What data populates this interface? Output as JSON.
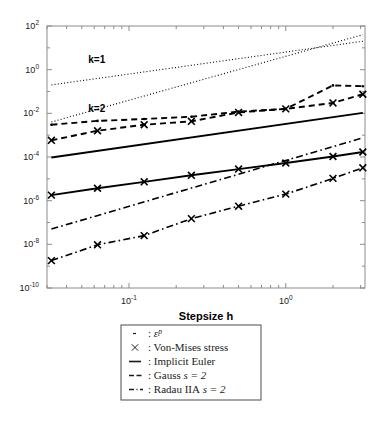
{
  "figure": {
    "background": "#ffffff",
    "axis_color": "#8c8c8c",
    "line_color": "#000000"
  },
  "labels": {
    "k1": "k=1",
    "k2": "k=2",
    "xaxis_title": "Stepsize h"
  },
  "yticks": [
    {
      "base": "10",
      "exp": "2"
    },
    {
      "base": "10",
      "exp": "0"
    },
    {
      "base": "10",
      "exp": "-2"
    },
    {
      "base": "10",
      "exp": "-4"
    },
    {
      "base": "10",
      "exp": "-6"
    },
    {
      "base": "10",
      "exp": "-8"
    },
    {
      "base": "10",
      "exp": "-10"
    }
  ],
  "xticks": [
    {
      "base": "10",
      "exp": "-1"
    },
    {
      "base": "10",
      "exp": "0"
    }
  ],
  "legend": {
    "items": [
      {
        "symbol": "dotted",
        "sep": ":",
        "label": "ε",
        "sup": "p",
        "italic_label": true
      },
      {
        "symbol": "cross",
        "sep": ":",
        "label": "Von-Mises stress",
        "sup": "",
        "italic_label": false
      },
      {
        "symbol": "solid",
        "sep": ":",
        "label": "Implicit Euler",
        "sup": "",
        "italic_label": false
      },
      {
        "symbol": "dashed",
        "sep": ":",
        "label": "Gauss",
        "sup": "",
        "italic_label": false,
        "math": "s = 2"
      },
      {
        "symbol": "dashdot",
        "sep": ":",
        "label": "Radau IIA",
        "sup": "",
        "italic_label": false,
        "math": "s = 2"
      }
    ]
  },
  "chart_data": {
    "type": "line",
    "scale": "log-log",
    "title": "",
    "xlabel": "Stepsize h",
    "ylabel": "",
    "xlim": [
      0.03,
      3.2
    ],
    "ylim": [
      1e-10,
      100
    ],
    "xticks": [
      0.1,
      1
    ],
    "yticks": [
      1e-10,
      1e-08,
      1e-06,
      0.0001,
      0.01,
      1,
      100
    ],
    "grid": false,
    "legend_position": "below-plot",
    "annotations": [
      {
        "text": "k=1",
        "x": 0.055,
        "y": 2.0
      },
      {
        "text": "k=2",
        "x": 0.055,
        "y": 0.012
      }
    ],
    "series": [
      {
        "name": "k=1 reference slope",
        "style": "dotted",
        "marker": "none",
        "slope": 1,
        "x": [
          0.032,
          3.1
        ],
        "y": [
          0.2,
          20
        ]
      },
      {
        "name": "k=2 reference slope",
        "style": "dotted",
        "marker": "none",
        "slope": 2,
        "x": [
          0.032,
          3.1
        ],
        "y": [
          0.004,
          40
        ]
      },
      {
        "name": "Gauss s=2 - plastic strain",
        "style": "dashed",
        "marker": "dot",
        "x": [
          0.032,
          0.063,
          0.125,
          0.25,
          0.5,
          1.0,
          2.0,
          3.1
        ],
        "y": [
          0.003,
          0.0045,
          0.0055,
          0.007,
          0.012,
          0.016,
          0.19,
          0.175
        ]
      },
      {
        "name": "Gauss s=2 - Von-Mises stress",
        "style": "dashed",
        "marker": "cross",
        "x": [
          0.032,
          0.063,
          0.125,
          0.25,
          0.5,
          1.0,
          2.0,
          3.1
        ],
        "y": [
          0.00058,
          0.0016,
          0.003,
          0.0043,
          0.011,
          0.016,
          0.03,
          0.075
        ]
      },
      {
        "name": "Implicit Euler - plastic strain",
        "style": "solid",
        "marker": "none",
        "x": [
          0.032,
          3.1
        ],
        "y": [
          9.5e-05,
          0.0105
        ]
      },
      {
        "name": "Implicit Euler - Von-Mises stress",
        "style": "solid",
        "marker": "cross",
        "x": [
          0.032,
          0.063,
          0.125,
          0.25,
          0.5,
          1.0,
          2.0,
          3.1
        ],
        "y": [
          1.8e-06,
          3.7e-06,
          7.3e-06,
          1.45e-05,
          2.8e-05,
          5.3e-05,
          0.000105,
          0.00017
        ]
      },
      {
        "name": "Radau IIA s=2 - plastic strain",
        "style": "dashdot",
        "marker": "none",
        "x": [
          0.032,
          3.1
        ],
        "y": [
          5e-08,
          0.00075
        ]
      },
      {
        "name": "Radau IIA s=2 - Von-Mises stress",
        "style": "dashdot",
        "marker": "cross",
        "x": [
          0.032,
          0.063,
          0.125,
          0.25,
          0.5,
          1.0,
          2.0,
          3.1
        ],
        "y": [
          1.8e-09,
          9.5e-09,
          2.5e-08,
          1.5e-07,
          5.6e-07,
          2e-06,
          1.05e-05,
          3.2e-05
        ]
      }
    ]
  }
}
